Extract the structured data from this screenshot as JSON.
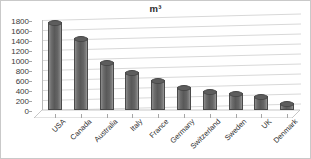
{
  "chart_data": {
    "type": "bar",
    "title": "m³",
    "xlabel": "",
    "ylabel": "",
    "categories": [
      "USA",
      "Canada",
      "Australia",
      "Italy",
      "France",
      "Germany",
      "Switzerland",
      "Sweden",
      "UK",
      "Denmark"
    ],
    "values": [
      1760,
      1450,
      970,
      760,
      600,
      460,
      380,
      340,
      290,
      140
    ],
    "series": [
      {
        "name": "m³",
        "values": [
          1760,
          1450,
          970,
          760,
          600,
          460,
          380,
          340,
          290,
          140
        ]
      }
    ],
    "ylim": [
      0,
      1800
    ],
    "ytick_labels": [
      "1800",
      "1600",
      "1400",
      "1200",
      "1000",
      "800",
      "600",
      "400",
      "200",
      "0"
    ],
    "ytick_values": [
      1800,
      1600,
      1400,
      1200,
      1000,
      800,
      600,
      400,
      200,
      0
    ],
    "ytick_step": 200,
    "grid": true,
    "legend": false,
    "legend_position": "none",
    "style": "3d-cylinder",
    "bar_color": "#5d5d5d",
    "grid_color": "#d8d8d8",
    "axis_color": "#a6a6a6",
    "background": "#ffffff"
  }
}
